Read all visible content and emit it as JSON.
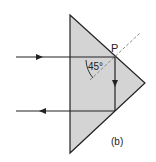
{
  "diagram": {
    "type": "ray-optics-prism",
    "labels": {
      "point": "P",
      "angle": "45°",
      "caption": "(b)"
    },
    "colors": {
      "prism_fill": "#d4d4d4",
      "line": "#222222",
      "dashed": "#888888",
      "background": "#ffffff"
    },
    "prism": {
      "vertices": [
        [
          70,
          15
        ],
        [
          145,
          83
        ],
        [
          70,
          153
        ]
      ]
    },
    "rays": [
      {
        "name": "incident-ray",
        "from": [
          16,
          57
        ],
        "to": [
          115,
          57
        ],
        "direction": "right"
      },
      {
        "name": "reflected-ray-internal",
        "from": [
          115,
          57
        ],
        "to": [
          115,
          111
        ],
        "direction": "down"
      },
      {
        "name": "emergent-ray",
        "from": [
          115,
          111
        ],
        "to": [
          16,
          111
        ],
        "direction": "left"
      }
    ],
    "normal": {
      "from": [
        90,
        80
      ],
      "to": [
        140,
        33
      ],
      "style": "dashed"
    }
  }
}
